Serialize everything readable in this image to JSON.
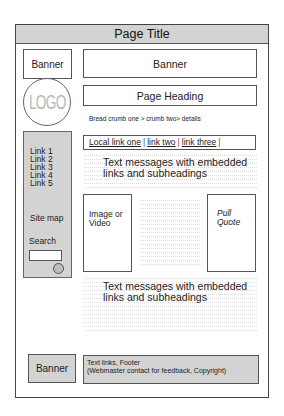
{
  "title_bar": {
    "title": "Page Title"
  },
  "header": {
    "left_banner": "Banner",
    "top_banner": "Banner",
    "logo": "LOGO",
    "page_heading": "Page Heading"
  },
  "breadcrumb": {
    "text": "Bread crumb one > crumb two> details"
  },
  "local_links": {
    "items": [
      "Local link one",
      "link two",
      "link three"
    ],
    "separator": "|"
  },
  "sidebar": {
    "links": [
      "Link 1",
      "Link 2",
      "Link 3",
      "Link 4",
      "Link 5"
    ],
    "site_map": "Site map",
    "search_label": "Search"
  },
  "content": {
    "text_block_1": "Text messages with embedded links and subheadings",
    "image_box": "Image or Video",
    "pull_quote": "Pull Quote",
    "text_block_2": "Text messages with embedded links and subheadings"
  },
  "footer": {
    "banner": "Banner",
    "line1": "Text links, Footer",
    "line2": "(Webmaster contact for feedback, Copyright)"
  },
  "colors": {
    "panel_gray": "#d3d3d3",
    "border": "#555555",
    "logo_text": "#b8b8b8"
  }
}
